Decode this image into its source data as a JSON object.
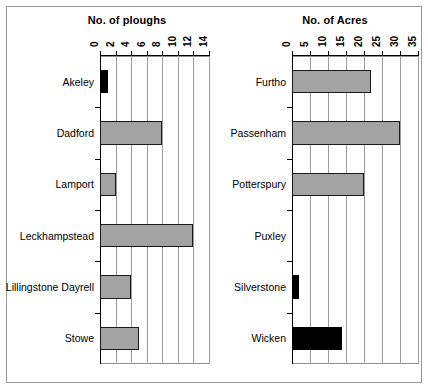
{
  "chart_data": [
    {
      "type": "bar",
      "orientation": "horizontal",
      "title": "No. of ploughs",
      "xlabel": "",
      "ylabel": "",
      "xlim": [
        0,
        14
      ],
      "xticks": [
        0,
        2,
        4,
        6,
        8,
        10,
        12,
        14
      ],
      "xticklabels": [
        "0",
        "2",
        "4",
        "6",
        "8",
        "10",
        "12",
        "14"
      ],
      "axis_position": "top",
      "grid": true,
      "categories": [
        "Akeley",
        "Dadford",
        "Lamport",
        "Leckhampstead",
        "Lillingstone Dayrell",
        "Stowe"
      ],
      "values": [
        1,
        8,
        2,
        12,
        4,
        5
      ],
      "bar_colors": [
        "#000000",
        "#a3a3a3",
        "#a3a3a3",
        "#a3a3a3",
        "#a3a3a3",
        "#a3a3a3"
      ],
      "legend": null
    },
    {
      "type": "bar",
      "orientation": "horizontal",
      "title": "No. of Acres",
      "xlabel": "",
      "ylabel": "",
      "xlim": [
        0,
        35
      ],
      "xticks": [
        0,
        5,
        10,
        15,
        20,
        25,
        30,
        35
      ],
      "xticklabels": [
        "0",
        "5",
        "10",
        "15",
        "20",
        "25",
        "30",
        "35"
      ],
      "axis_position": "top",
      "grid": true,
      "categories": [
        "Furtho",
        "Passenham",
        "Potterspury",
        "Puxley",
        "Silverstone",
        "Wicken"
      ],
      "values": [
        22,
        30,
        20,
        0,
        2,
        14
      ],
      "bar_colors": [
        "#a3a3a3",
        "#a3a3a3",
        "#a3a3a3",
        "#a3a3a3",
        "#000000",
        "#000000"
      ],
      "legend": null
    }
  ],
  "colors": {
    "gray_fill": "#a3a3a3",
    "black_fill": "#000000",
    "gridline": "#9d9d9d",
    "axis": "#000000",
    "frame": "#9a9a9a",
    "background": "#ffffff"
  }
}
